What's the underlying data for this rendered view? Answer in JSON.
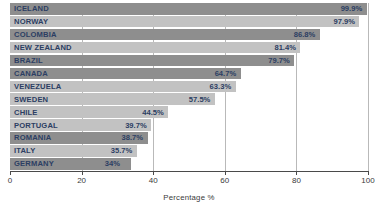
{
  "chart_data": {
    "type": "bar",
    "orientation": "horizontal",
    "title": "",
    "subtitle": "",
    "xlabel": "Percentage %",
    "ylabel": "",
    "xlim": [
      0,
      100
    ],
    "xticks": [
      "0",
      "20",
      "40",
      "60",
      "80",
      "100"
    ],
    "xtick_values": [
      0,
      20,
      40,
      60,
      80,
      100
    ],
    "grid": true,
    "legend": "none",
    "categories": [
      "ICELAND",
      "NORWAY",
      "COLOMBIA",
      "NEW ZEALAND",
      "BRAZIL",
      "CANADA",
      "VENEZUELA",
      "SWEDEN",
      "CHILE",
      "PORTUGAL",
      "ROMANIA",
      "ITALY",
      "GERMANY"
    ],
    "values": [
      99.9,
      97.9,
      86.8,
      81.4,
      79.7,
      64.7,
      63.3,
      57.5,
      44.5,
      39.7,
      38.7,
      35.7,
      34
    ],
    "value_labels": [
      "99.9%",
      "97.9%",
      "86.8%",
      "81.4%",
      "79.7%",
      "64.7%",
      "63.3%",
      "57.5%",
      "44.5%",
      "39.7%",
      "38.7%",
      "35.7%",
      "34%"
    ],
    "bar_shades": [
      "dark",
      "light",
      "dark",
      "light",
      "dark",
      "dark",
      "light",
      "light",
      "light",
      "light",
      "dark",
      "light",
      "dark"
    ],
    "colors": {
      "bar_dark": "#8e8e8e",
      "bar_light": "#c2c2c2",
      "text": "#2c3e63",
      "axis": "#4a4a4a",
      "grid": "#b9b9b9",
      "background": "#ffffff"
    }
  }
}
